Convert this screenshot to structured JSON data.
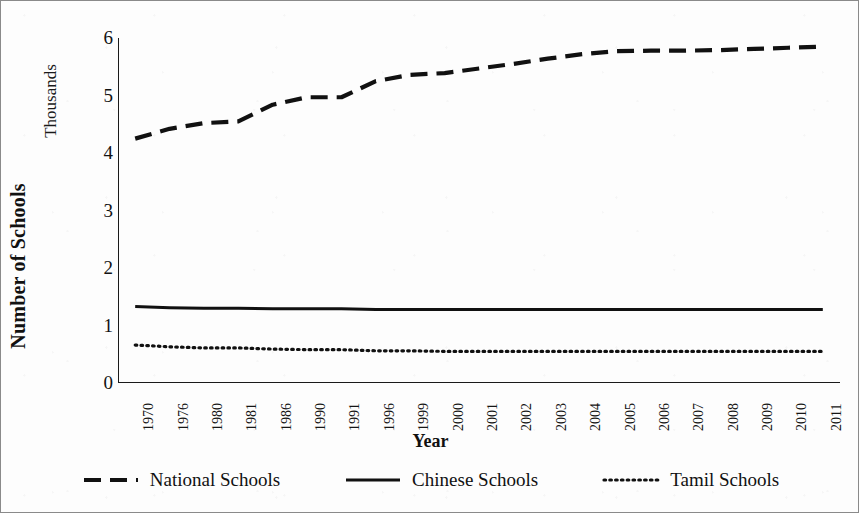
{
  "chart_data": {
    "type": "line",
    "title": "",
    "xlabel": "Year",
    "ylabel": "Number of Schools",
    "y_units_label": "Thousands",
    "ylim": [
      0,
      6
    ],
    "yticks": [
      0,
      1,
      2,
      3,
      4,
      5,
      6
    ],
    "grid": false,
    "legend_position": "bottom",
    "categories": [
      "1970",
      "1976",
      "1980",
      "1981",
      "1986",
      "1990",
      "1991",
      "1996",
      "1999",
      "2000",
      "2001",
      "2002",
      "2003",
      "2004",
      "2005",
      "2006",
      "2007",
      "2008",
      "2009",
      "2010",
      "2011"
    ],
    "series": [
      {
        "name": "National Schools",
        "style": "dashed",
        "color": "#111111",
        "values": [
          4.25,
          4.42,
          4.52,
          4.55,
          4.84,
          4.97,
          4.97,
          5.25,
          5.36,
          5.39,
          5.47,
          5.55,
          5.64,
          5.72,
          5.77,
          5.78,
          5.78,
          5.79,
          5.81,
          5.83,
          5.85
        ]
      },
      {
        "name": "Chinese Schools",
        "style": "solid",
        "color": "#111111",
        "values": [
          1.33,
          1.31,
          1.3,
          1.3,
          1.29,
          1.29,
          1.29,
          1.28,
          1.28,
          1.28,
          1.28,
          1.28,
          1.28,
          1.28,
          1.28,
          1.28,
          1.28,
          1.28,
          1.28,
          1.28,
          1.28
        ]
      },
      {
        "name": "Tamil Schools",
        "style": "dotted",
        "color": "#111111",
        "values": [
          0.66,
          0.63,
          0.61,
          0.61,
          0.59,
          0.58,
          0.58,
          0.56,
          0.56,
          0.55,
          0.55,
          0.55,
          0.55,
          0.55,
          0.55,
          0.55,
          0.55,
          0.55,
          0.55,
          0.55,
          0.55
        ]
      }
    ]
  },
  "axis": {
    "y_title": "Number of Schools",
    "y_units": "Thousands",
    "x_title": "Year"
  },
  "legend": {
    "items": [
      {
        "label": "National Schools",
        "style": "dashed"
      },
      {
        "label": "Chinese Schools",
        "style": "solid"
      },
      {
        "label": "Tamil Schools",
        "style": "dotted"
      }
    ]
  }
}
